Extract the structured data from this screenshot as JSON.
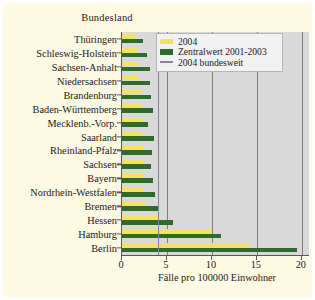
{
  "chart_data": {
    "type": "bar",
    "orientation": "horizontal",
    "title": "",
    "ylabel": "Bundesland",
    "xlabel": "Fälle pro 100000 Einwohner",
    "xlim": [
      0,
      20.8
    ],
    "xticks": [
      0,
      5,
      10,
      15,
      20
    ],
    "xticklabels": [
      "0",
      "5",
      "10",
      "15",
      "20"
    ],
    "grid": "vertical gridlines at x ticks",
    "legend_position": "top-right inside plot",
    "categories": [
      "Thüringen",
      "Schleswig-Holstein",
      "Sachsen-Anhalt",
      "Niedersachsen",
      "Brandenburg",
      "Baden-Württemberg",
      "Mecklenb.-Vorp.",
      "Saarland",
      "Rheinland-Pfalz",
      "Sachsen",
      "Bayern",
      "Nordrhein-Westfalen",
      "Bremen",
      "Hessen",
      "Hamburg",
      "Berlin"
    ],
    "series": [
      {
        "name": "2004",
        "color": "#f2e45f",
        "values": [
          1.5,
          1.7,
          1.8,
          1.9,
          2.1,
          2.1,
          2.2,
          2.2,
          2.3,
          2.4,
          2.4,
          2.5,
          2.6,
          4.0,
          10.0,
          14.1
        ]
      },
      {
        "name": "Zentralwert 2001-2003",
        "color": "#2e6b2c",
        "values": [
          2.3,
          2.8,
          3.1,
          3.1,
          3.2,
          3.4,
          2.9,
          3.6,
          3.3,
          3.2,
          3.5,
          3.7,
          4.0,
          5.7,
          11.0,
          19.5
        ]
      }
    ],
    "reference_line": {
      "name": "2004 bundesweit",
      "color": "#8d7ca6",
      "value": 3.95
    },
    "legend": [
      {
        "label": "2004",
        "marker": "yellow-swatch"
      },
      {
        "label": "Zentralwert 2001-2003",
        "marker": "green-swatch"
      },
      {
        "label": "2004 bundesweit",
        "marker": "purple-line"
      }
    ],
    "colors": {
      "plot_background": "#d9d9d9",
      "figure_background": "#fdfbe4",
      "gridline": "#7d7d7d",
      "axis": "#5a5a5a",
      "series_2004": "#f2e45f",
      "series_zentralwert": "#2e6b2c",
      "reference_line": "#8d7ca6"
    }
  }
}
